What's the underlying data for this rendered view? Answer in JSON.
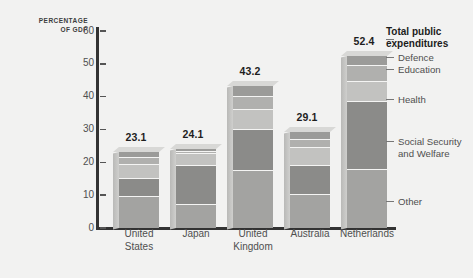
{
  "chart_data": {
    "type": "bar",
    "subtype": "stacked-bar",
    "title": "",
    "xlabel": "",
    "ylabel": "PERCENTAGE OF GDP",
    "ylim": [
      0,
      60
    ],
    "yticks": [
      0,
      10,
      20,
      30,
      40,
      50,
      60
    ],
    "grid": false,
    "legend_position": "right",
    "categories": [
      "United States",
      "Japan",
      "United Kingdom",
      "Australia",
      "Netherlands"
    ],
    "totals": [
      23.1,
      24.1,
      43.2,
      29.1,
      52.4
    ],
    "series": [
      {
        "name": "Other",
        "color": "#a3a3a1",
        "values": [
          9.5,
          7.0,
          17.5,
          10.0,
          17.8
        ]
      },
      {
        "name": "Social Security and Welfare",
        "color": "#8b8b89",
        "values": [
          5.5,
          12.0,
          12.3,
          8.8,
          20.5
        ]
      },
      {
        "name": "Health",
        "color": "#c2c2c0",
        "values": [
          4.3,
          3.4,
          6.0,
          5.5,
          6.2
        ]
      },
      {
        "name": "Education",
        "color": "#b0b0ae",
        "values": [
          2.0,
          0.8,
          4.2,
          2.6,
          5.0
        ]
      },
      {
        "name": "Defence",
        "color": "#9b9b99",
        "values": [
          1.8,
          0.9,
          3.2,
          2.2,
          2.9
        ]
      }
    ],
    "legend_entries": [
      "Defence",
      "Education",
      "Health",
      "Social Security and Welfare",
      "Other"
    ],
    "legend_title": "Total public expenditures"
  },
  "axis": {
    "title_line1": "PERCENTAGE",
    "title_line2": "OF GDP"
  },
  "legend": {
    "title_line1": "Total public",
    "title_line2": "expenditures",
    "defence": "Defence",
    "education": "Education",
    "health": "Health",
    "social_line1": "Social Security",
    "social_line2": "and Welfare",
    "other": "Other"
  },
  "ticks": {
    "t0": "0",
    "t10": "10",
    "t20": "20",
    "t30": "30",
    "t40": "40",
    "t50": "50",
    "t60": "60"
  },
  "bars": [
    {
      "country_line1": "United",
      "country_line2": "States",
      "value": "23.1"
    },
    {
      "country_line1": "Japan",
      "country_line2": "",
      "value": "24.1"
    },
    {
      "country_line1": "United",
      "country_line2": "Kingdom",
      "value": "43.2"
    },
    {
      "country_line1": "Australia",
      "country_line2": "",
      "value": "29.1"
    },
    {
      "country_line1": "Netherlands",
      "country_line2": "",
      "value": "52.4"
    }
  ]
}
